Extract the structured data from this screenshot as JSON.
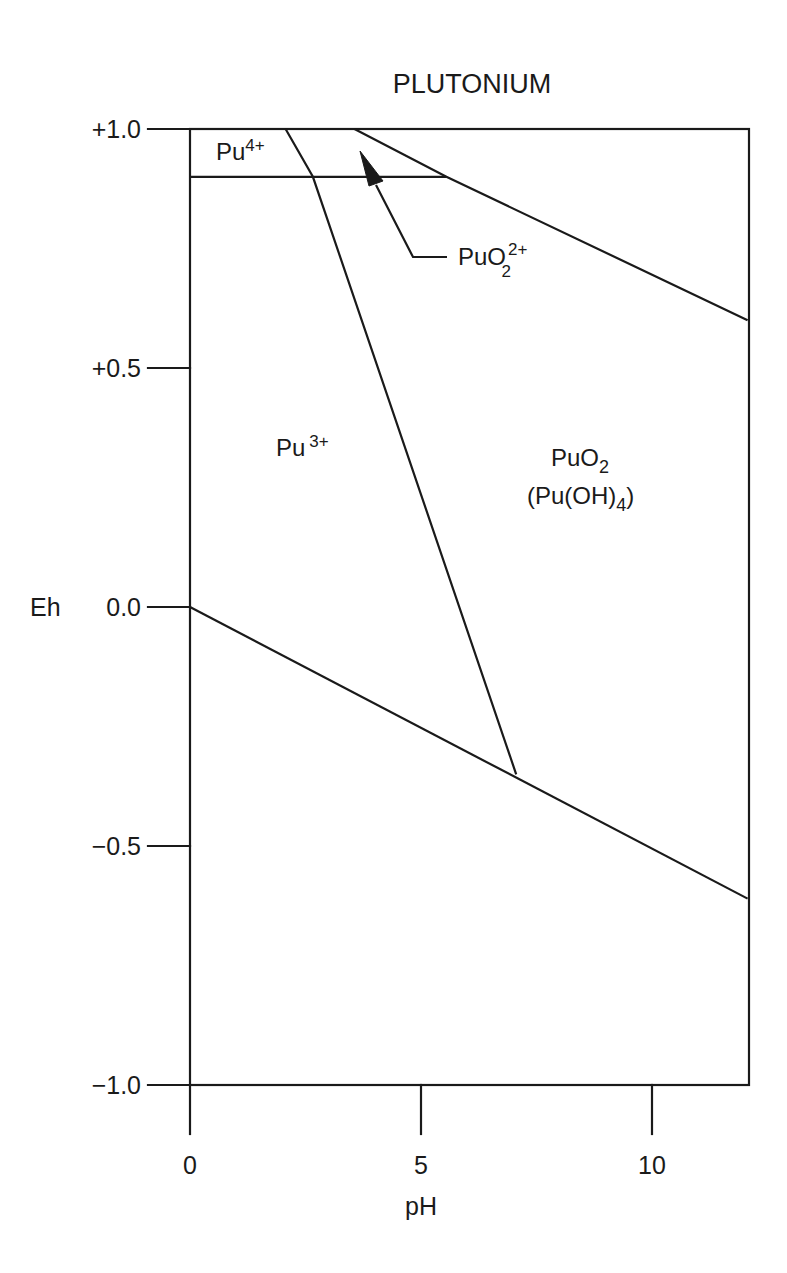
{
  "chart_data": {
    "type": "line",
    "subtype": "pourbaix-diagram",
    "title": "PLUTONIUM",
    "xlabel": "pH",
    "ylabel": "Eh",
    "xlim": [
      0,
      12.1
    ],
    "ylim": [
      -1.0,
      1.0
    ],
    "xticks": [
      0,
      5,
      10
    ],
    "xtick_labels": [
      "0",
      "5",
      "10"
    ],
    "yticks": [
      1.0,
      0.5,
      0.0,
      -0.5,
      -1.0
    ],
    "ytick_labels": [
      "+1.0",
      "+0.5",
      "0.0",
      "-0.5",
      "-1.0"
    ],
    "grid": false,
    "legend": null,
    "series": [
      {
        "name": "Pu4+/Pu3+ boundary",
        "x": [
          0,
          5.55
        ],
        "y": [
          0.9,
          0.9
        ]
      },
      {
        "name": "Pu4+ & Pu3+ / PuO2 boundary",
        "x": [
          2.07,
          2.66,
          7.06
        ],
        "y": [
          1.0,
          0.9,
          -0.35
        ]
      },
      {
        "name": "PuO2(2+) / PuO2 boundary",
        "x": [
          3.56,
          5.55,
          12.07
        ],
        "y": [
          1.0,
          0.9,
          0.6
        ]
      },
      {
        "name": "Water stability lower limit",
        "x": [
          0,
          12.07
        ],
        "y": [
          0.0,
          -0.61
        ]
      }
    ],
    "regions": [
      {
        "label": "Pu4+",
        "species": "Pu",
        "charge": "4+",
        "pH": 0.9,
        "Eh": 0.95
      },
      {
        "label": "Pu3+",
        "species": "Pu",
        "charge": "3+",
        "pH": 2.3,
        "Eh": 0.33
      },
      {
        "label": "PuO2 2+",
        "species": "PuO",
        "subscript": "2",
        "charge": "2+",
        "pH": 6.1,
        "Eh": 0.72,
        "arrow_to": {
          "pH": 3.67,
          "Eh": 0.95
        }
      },
      {
        "label": "PuO2 (Pu(OH)4)",
        "species": "PuO",
        "subscript": "2",
        "alt": "(Pu(OH)4)",
        "pH": 8.5,
        "Eh": 0.28
      }
    ]
  },
  "labels": {
    "title": "PLUTONIUM",
    "xlabel": "pH",
    "ylabel": "Eh",
    "pu4": {
      "base": "Pu",
      "sup": "4+"
    },
    "pu3": {
      "base": "Pu",
      "sup": "3+"
    },
    "puo2_ion": {
      "base": "PuO",
      "sub": "2",
      "sup": "2+"
    },
    "puo2": {
      "base": "PuO",
      "sub": "2"
    },
    "puoh4": {
      "open": "(Pu(OH)",
      "sub": "4",
      "close": ")"
    }
  },
  "colors": {
    "ink": "#1a1a1a",
    "background": "#ffffff"
  }
}
